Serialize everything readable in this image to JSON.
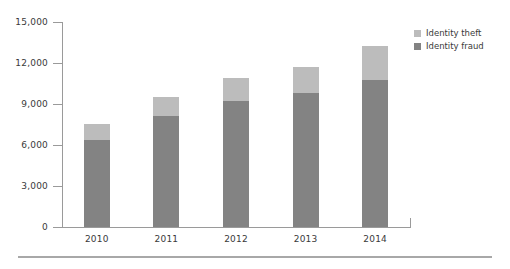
{
  "chart_data": {
    "type": "bar",
    "subtype": "stacked-vertical",
    "title": "",
    "subtitle": "",
    "xlabel": "",
    "ylabel": "",
    "categories": [
      "2010",
      "2011",
      "2012",
      "2013",
      "2014"
    ],
    "series": [
      {
        "name": "Identity fraud",
        "color": "#838383",
        "values": [
          6370,
          8130,
          9220,
          9810,
          10760
        ]
      },
      {
        "name": "Identity theft",
        "color": "#bcbcbc",
        "values": [
          1170,
          1390,
          1690,
          1900,
          2490
        ]
      }
    ],
    "totals": [
      7540,
      9520,
      10910,
      11710,
      13250
    ],
    "ylim": [
      0,
      15000
    ],
    "yticks": [
      0,
      3000,
      6000,
      9000,
      12000,
      15000
    ],
    "ytick_labels": [
      "0",
      "3,000",
      "6,000",
      "9,000",
      "12,000",
      "15,000"
    ],
    "grid": false,
    "legend_position": "top-right"
  },
  "legend": {
    "items": [
      {
        "label": "Identity theft",
        "color": "#bcbcbc"
      },
      {
        "label": "Identity fraud",
        "color": "#838383"
      }
    ]
  },
  "colors": {
    "theft": "#bcbcbc",
    "fraud": "#838383",
    "axis": "#9a9a9a",
    "text": "#3a3a3a",
    "rule": "#a8a8a8",
    "background": "#ffffff"
  }
}
